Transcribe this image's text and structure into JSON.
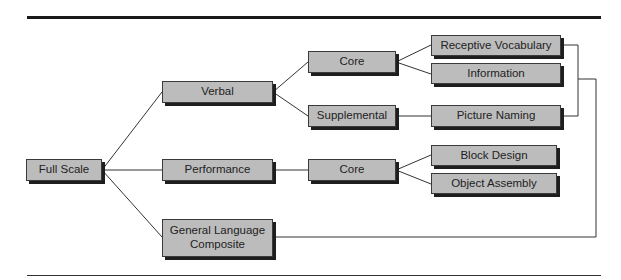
{
  "diagram": {
    "type": "hierarchy",
    "nodes": {
      "full_scale": "Full Scale",
      "verbal": "Verbal",
      "performance": "Performance",
      "general_language_composite": "General Language Composite",
      "verbal_core": "Core",
      "verbal_supplemental": "Supplemental",
      "receptive_vocabulary": "Receptive Vocabulary",
      "information": "Information",
      "picture_naming": "Picture Naming",
      "performance_core": "Core",
      "block_design": "Block Design",
      "object_assembly": "Object Assembly"
    },
    "edges": [
      [
        "Full Scale",
        "Verbal"
      ],
      [
        "Full Scale",
        "Performance"
      ],
      [
        "Full Scale",
        "General Language Composite"
      ],
      [
        "Verbal",
        "Core"
      ],
      [
        "Verbal",
        "Supplemental"
      ],
      [
        "Core",
        "Receptive Vocabulary"
      ],
      [
        "Core",
        "Information"
      ],
      [
        "Supplemental",
        "Picture Naming"
      ],
      [
        "Performance",
        "Core"
      ],
      [
        "Core",
        "Block Design"
      ],
      [
        "Core",
        "Object Assembly"
      ],
      [
        "Receptive Vocabulary + Picture Naming",
        "General Language Composite"
      ]
    ]
  }
}
